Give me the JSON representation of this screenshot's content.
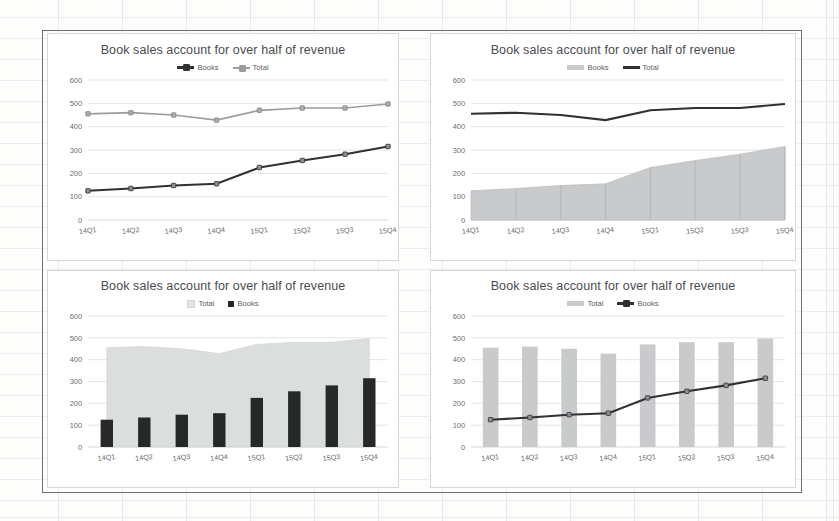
{
  "document": {
    "kind": "spreadsheet-chart-sheet",
    "chart_count": 4
  },
  "charts": {
    "top_left": {
      "title": "Book sales account for over half of revenue",
      "legend": [
        {
          "label": "Books",
          "marker": "dark-line-with-marker"
        },
        {
          "label": "Total",
          "marker": "gray-line-with-marker"
        }
      ]
    },
    "top_right": {
      "title": "Book sales account for over half of revenue",
      "legend": [
        {
          "label": "Books",
          "marker": "gray-area-swatch"
        },
        {
          "label": "Total",
          "marker": "dark-line"
        }
      ]
    },
    "bottom_left": {
      "title": "Book sales account for over half of revenue",
      "legend": [
        {
          "label": "Total",
          "marker": "light-area-swatch"
        },
        {
          "label": "Books",
          "marker": "dark-square"
        }
      ]
    },
    "bottom_right": {
      "title": "Book sales account for over half of revenue",
      "legend": [
        {
          "label": "Total",
          "marker": "gray-bar-swatch"
        },
        {
          "label": "Books",
          "marker": "dark-line-with-marker"
        }
      ]
    }
  },
  "chart_data": [
    {
      "id": "top-left",
      "type": "line",
      "title": "Book sales account for over half of revenue",
      "xlabel": "",
      "ylabel": "",
      "categories": [
        "14Q1",
        "14Q2",
        "14Q3",
        "14Q4",
        "15Q1",
        "15Q2",
        "15Q3",
        "15Q4"
      ],
      "yticks": [
        0,
        100,
        200,
        300,
        400,
        500,
        600
      ],
      "ylim": [
        0,
        600
      ],
      "grid": true,
      "legend_position": "top-center",
      "series": [
        {
          "name": "Books",
          "values": [
            125,
            135,
            148,
            155,
            225,
            255,
            282,
            315
          ],
          "style": "dark-line-markers",
          "color": "#2f3133"
        },
        {
          "name": "Total",
          "values": [
            455,
            460,
            450,
            428,
            470,
            480,
            480,
            497
          ],
          "style": "gray-line-markers",
          "color": "#9a9c9e"
        }
      ]
    },
    {
      "id": "top-right",
      "type": "area",
      "title": "Book sales account for over half of revenue",
      "xlabel": "",
      "ylabel": "",
      "categories": [
        "14Q1",
        "14Q2",
        "14Q3",
        "14Q4",
        "15Q1",
        "15Q2",
        "15Q3",
        "15Q4"
      ],
      "yticks": [
        0,
        100,
        200,
        300,
        400,
        500,
        600
      ],
      "ylim": [
        0,
        600
      ],
      "grid": true,
      "legend_position": "top-center",
      "series": [
        {
          "name": "Books",
          "values": [
            125,
            135,
            148,
            155,
            225,
            255,
            282,
            315
          ],
          "style": "gray-area",
          "color": "#c9cacb"
        },
        {
          "name": "Total",
          "values": [
            455,
            460,
            450,
            428,
            470,
            480,
            480,
            497
          ],
          "style": "dark-line",
          "color": "#2f3133"
        }
      ]
    },
    {
      "id": "bottom-left",
      "type": "bar",
      "title": "Book sales account for over half of revenue",
      "xlabel": "",
      "ylabel": "",
      "categories": [
        "14Q1",
        "14Q2",
        "14Q3",
        "14Q4",
        "15Q1",
        "15Q2",
        "15Q3",
        "15Q4"
      ],
      "yticks": [
        0,
        100,
        200,
        300,
        400,
        500,
        600
      ],
      "ylim": [
        0,
        600
      ],
      "grid": true,
      "legend_position": "top-center",
      "series": [
        {
          "name": "Total",
          "values": [
            455,
            460,
            450,
            428,
            470,
            480,
            480,
            497
          ],
          "style": "light-area",
          "color": "#dcdddd"
        },
        {
          "name": "Books",
          "values": [
            125,
            135,
            148,
            155,
            225,
            255,
            282,
            315
          ],
          "style": "dark-bars",
          "color": "#262829"
        }
      ]
    },
    {
      "id": "bottom-right",
      "type": "bar",
      "title": "Book sales account for over half of revenue",
      "xlabel": "",
      "ylabel": "",
      "categories": [
        "14Q1",
        "14Q2",
        "14Q3",
        "14Q4",
        "15Q1",
        "15Q2",
        "15Q3",
        "15Q4"
      ],
      "yticks": [
        0,
        100,
        200,
        300,
        400,
        500,
        600
      ],
      "ylim": [
        0,
        600
      ],
      "grid": true,
      "legend_position": "top-center",
      "series": [
        {
          "name": "Total",
          "values": [
            455,
            460,
            450,
            428,
            470,
            480,
            480,
            497
          ],
          "style": "gray-bars",
          "color": "#c9cacb"
        },
        {
          "name": "Books",
          "values": [
            125,
            135,
            148,
            155,
            225,
            255,
            282,
            315
          ],
          "style": "dark-line-markers",
          "color": "#2f3133"
        }
      ]
    }
  ],
  "colors": {
    "dark": "#2f3133",
    "bar_dark": "#262829",
    "gray": "#9a9c9e",
    "area_gray": "#c9cacb",
    "area_light": "#dcdddd",
    "grid": "#e3e4e5",
    "text": "#4a4c4f",
    "tick_text": "#6b6d70"
  }
}
